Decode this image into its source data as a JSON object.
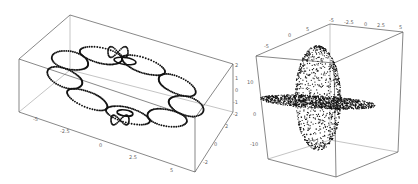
{
  "chart_data": [
    {
      "type": "scatter",
      "dimensions": 3,
      "title": "",
      "description": "3D point cloud forming a flattened elliptical ring of looped orbits with two small tight ellipses near the top and bottom",
      "axes": {
        "x": {
          "ticks": [
            "-5",
            "-2.5",
            "0",
            "2.5",
            "5"
          ],
          "range": [
            -5,
            5
          ]
        },
        "y": {
          "ticks": [
            "-2",
            "0",
            "2"
          ],
          "range": [
            -2,
            2
          ]
        },
        "z": {
          "ticks": [
            "-2",
            "-1",
            "0",
            "1",
            "2"
          ],
          "range": [
            -2,
            2
          ]
        }
      },
      "grid": false,
      "legend": null
    },
    {
      "type": "scatter",
      "dimensions": 3,
      "title": "",
      "description": "3D point cloud forming a vertically elongated ellipsoidal shell with a dense horizontal flattened disk through its middle",
      "axes": {
        "x": {
          "ticks": [
            "-5",
            "-2.5",
            "0",
            "2.5",
            "5"
          ],
          "range": [
            -5,
            5
          ]
        },
        "y": {
          "ticks": [
            "-5",
            "0",
            "5"
          ],
          "range": [
            -5,
            5
          ]
        },
        "z": {
          "ticks": [
            "-10",
            "0",
            "10"
          ],
          "range": [
            -12,
            12
          ]
        }
      },
      "grid": false,
      "legend": null
    }
  ],
  "left_plot": {
    "x_ticks": [
      "-5",
      "-2.5",
      "0",
      "2.5",
      "5"
    ],
    "y_ticks": [
      "2",
      "0",
      "-2"
    ],
    "z_ticks": [
      "2",
      "1",
      "0",
      "-1",
      "-2"
    ]
  },
  "right_plot": {
    "x_ticks": [
      "-5",
      "-2.5",
      "0",
      "2.5",
      "5"
    ],
    "y_ticks": [
      "-5",
      "0",
      "5"
    ],
    "z_ticks": [
      "10",
      "0",
      "-10"
    ]
  }
}
